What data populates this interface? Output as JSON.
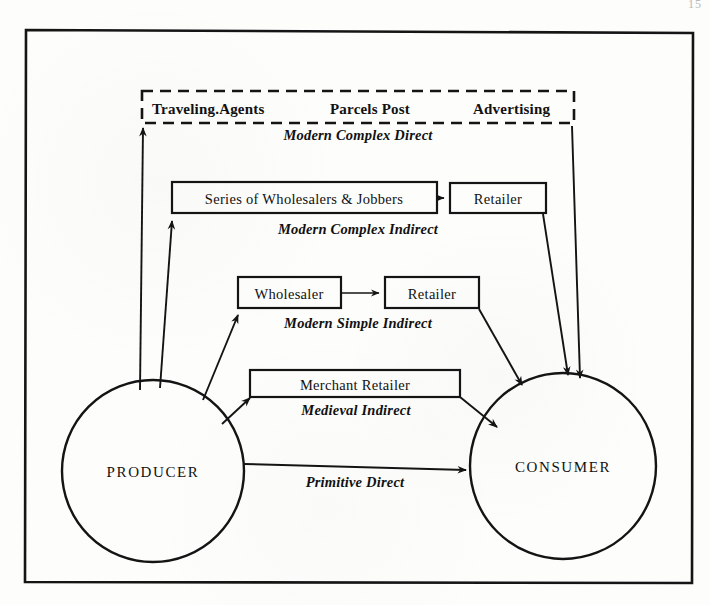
{
  "page": {
    "page_number": "15",
    "background_color": "#fdfdfb",
    "ink_color": "#111111"
  },
  "frame": {
    "label": "outer-border"
  },
  "nodes": {
    "producer": {
      "label": "PRODUCER",
      "cx": 153,
      "cy": 471,
      "r": 91
    },
    "consumer": {
      "label": "CONSUMER",
      "cx": 563,
      "cy": 466,
      "r": 93
    }
  },
  "dashed_box": {
    "items": [
      {
        "label": "Traveling.Agents",
        "x": 152
      },
      {
        "label": "Parcels Post",
        "x": 330
      },
      {
        "label": "Advertising",
        "x": 473
      }
    ],
    "channel_label": "Modern Complex Direct",
    "x": 142,
    "y": 91,
    "width": 432,
    "height": 32
  },
  "boxes": [
    {
      "name": "series-of-wholesalers-box",
      "label": "Series of Wholesalers & Jobbers",
      "x": 172,
      "y": 182,
      "width": 265,
      "height": 31
    },
    {
      "name": "retailer-box-complex",
      "label": "Retailer",
      "x": 450,
      "y": 183,
      "width": 96,
      "height": 30
    },
    {
      "name": "wholesaler-box",
      "label": "Wholesaler",
      "x": 238,
      "y": 277,
      "width": 103,
      "height": 31
    },
    {
      "name": "retailer-box-simple",
      "label": "Retailer",
      "x": 385,
      "y": 277,
      "width": 94,
      "height": 31
    },
    {
      "name": "merchant-retailer-box",
      "label": "Merchant Retailer",
      "x": 250,
      "y": 370,
      "width": 210,
      "height": 27
    }
  ],
  "channel_labels": [
    {
      "name": "modern-complex-direct-label",
      "text": "Modern Complex Direct",
      "x": 358,
      "y": 139
    },
    {
      "name": "modern-complex-indirect-label",
      "text": "Modern Complex Indirect",
      "x": 358,
      "y": 232
    },
    {
      "name": "modern-simple-indirect-label",
      "text": "Modern Simple Indirect",
      "x": 358,
      "y": 326
    },
    {
      "name": "medieval-indirect-label",
      "text": "Medieval Indirect",
      "x": 356,
      "y": 413
    },
    {
      "name": "primitive-direct-label",
      "text": "Primitive Direct",
      "x": 355,
      "y": 477
    }
  ]
}
